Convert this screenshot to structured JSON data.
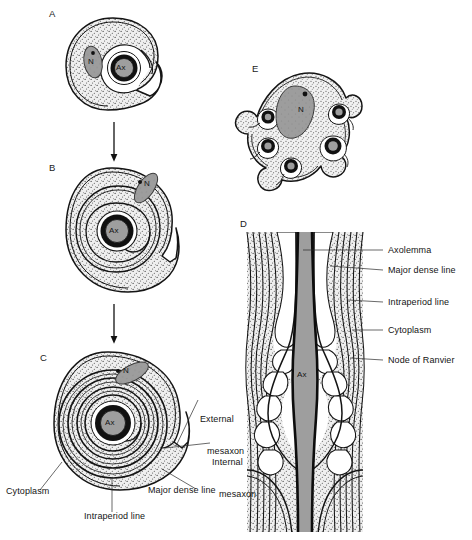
{
  "figure": {
    "background": "#ffffff",
    "ink": "#111111",
    "colors": {
      "cytoplasm_stipple": "#e9e9e9",
      "nucleus_gray": "#9a9a9a",
      "axon_gray": "#9e9e9e",
      "myelin_dark": "#111111",
      "outline": "#1a1a1a"
    }
  },
  "panels": [
    {
      "id": "A",
      "letter": "A",
      "caption_stage": "Schwann cell invaginated by a single axon; mesaxon not yet formed",
      "labels": [
        {
          "name": "nucleus",
          "text": "N"
        },
        {
          "name": "axon",
          "text": "Ax"
        }
      ]
    },
    {
      "id": "B",
      "letter": "B",
      "caption_stage": "Mesaxon elongates and begins to spiral around the axon",
      "labels": [
        {
          "name": "nucleus",
          "text": "N"
        },
        {
          "name": "axon",
          "text": "Ax"
        }
      ]
    },
    {
      "id": "C",
      "letter": "C",
      "caption_stage": "Compact myelin sheath formed by repeated spiralling of the mesaxon",
      "labels": [
        {
          "name": "nucleus",
          "text": "N"
        },
        {
          "name": "axon",
          "text": "Ax"
        }
      ],
      "callouts": [
        {
          "name": "external-mesaxon",
          "line1": "External",
          "line2": "mesaxon"
        },
        {
          "name": "internal-mesaxon",
          "line1": "Internal",
          "line2": "mesaxon"
        },
        {
          "name": "major-dense-line",
          "line1": "Major dense line",
          "line2": ""
        },
        {
          "name": "cytoplasm",
          "line1": "Cytoplasm",
          "line2": ""
        },
        {
          "name": "intraperiod-line",
          "line1": "Intraperiod line",
          "line2": ""
        }
      ]
    },
    {
      "id": "D",
      "letter": "D",
      "caption_stage": "Longitudinal section through a node of Ranvier",
      "labels": [
        {
          "name": "axon",
          "text": "Ax"
        }
      ],
      "callouts": [
        {
          "name": "axolemma",
          "text": "Axolemma"
        },
        {
          "name": "major-dense-line",
          "text": "Major dense line"
        },
        {
          "name": "intraperiod-line",
          "text": "Intraperiod line"
        },
        {
          "name": "cytoplasm",
          "text": "Cytoplasm"
        },
        {
          "name": "node-of-ranvier",
          "text": "Node of Ranvier"
        }
      ]
    },
    {
      "id": "E",
      "letter": "E",
      "caption_stage": "Single Schwann cell enveloping several unmyelinated axons",
      "labels": [
        {
          "name": "nucleus",
          "text": "N"
        }
      ],
      "axon_count": 6
    }
  ],
  "arrows": [
    {
      "name": "arrow-a-to-b",
      "direction": "down"
    },
    {
      "name": "arrow-b-to-c",
      "direction": "down"
    }
  ]
}
